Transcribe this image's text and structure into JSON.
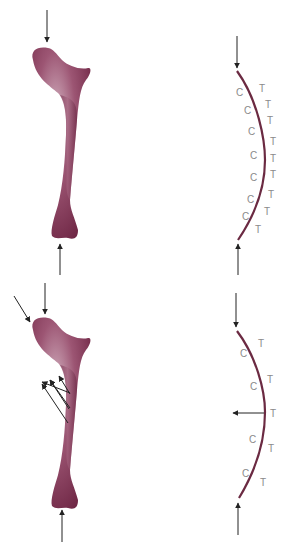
{
  "colors": {
    "bone": "#7a2f4c",
    "bone_light": "#c9a3b3",
    "beam": "#6b2a42",
    "arrow": "#333333",
    "label": "#8a8a8a"
  },
  "top_panel": {
    "labels": {
      "c": [
        "C",
        "C",
        "C",
        "C",
        "C",
        "C",
        "C"
      ],
      "t": [
        "T",
        "T",
        "T",
        "T",
        "T",
        "T",
        "T",
        "T",
        "T"
      ]
    }
  },
  "bottom_panel": {
    "labels": {
      "c": [
        "C",
        "C",
        "C",
        "C"
      ],
      "t": [
        "T",
        "T",
        "T",
        "T",
        "T"
      ]
    }
  }
}
